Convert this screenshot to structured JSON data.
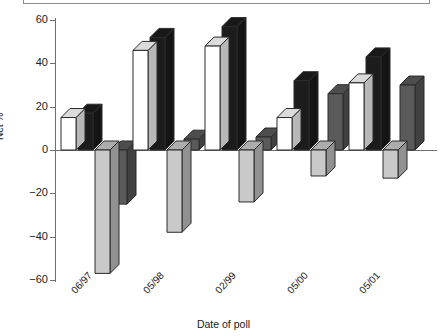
{
  "chart_data": {
    "type": "bar",
    "title": "",
    "xlabel": "Date of poll",
    "ylabel": "Net %",
    "ylim": [
      -60,
      60
    ],
    "yticks": [
      60,
      40,
      20,
      0,
      -20,
      -40,
      -60
    ],
    "ytick_labels": [
      "60",
      "40",
      "20",
      "0",
      "−20",
      "−40",
      "−60"
    ],
    "grid": false,
    "legend_position": "top",
    "categories": [
      "06/97",
      "05/98",
      "02/99",
      "05/00",
      "05/01"
    ],
    "series": [
      {
        "name": "series-1",
        "color": "#ffffff",
        "values": [
          15,
          46,
          48,
          15,
          31
        ]
      },
      {
        "name": "series-2",
        "color": "#1c1c1c",
        "values": [
          17,
          52,
          57,
          32,
          43
        ]
      },
      {
        "name": "series-3",
        "color": "#c9c9c9",
        "values": [
          -57,
          -38,
          -24,
          -12,
          -13
        ]
      },
      {
        "name": "series-4",
        "color": "#5a5a5a",
        "values": [
          -25,
          5,
          6,
          26,
          30
        ]
      }
    ]
  },
  "axis": {
    "y_title": "Net %",
    "x_title": "Date of poll"
  },
  "colors": {
    "axis": "#6f6f6f",
    "outline": "#2b2b2b",
    "white_bar": "#ffffff",
    "black_bar": "#1c1c1c",
    "light_gray_bar": "#c9c9c9",
    "dark_gray_bar": "#5a5a5a",
    "background": "#ffffff"
  }
}
